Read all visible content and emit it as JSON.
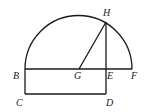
{
  "diagram": {
    "type": "geometry",
    "points": {
      "B": {
        "label": "B",
        "x": 25,
        "y": 69
      },
      "G": {
        "label": "G",
        "x": 79,
        "y": 69
      },
      "E": {
        "label": "E",
        "x": 106,
        "y": 69
      },
      "F": {
        "label": "F",
        "x": 132,
        "y": 69
      },
      "H": {
        "label": "H",
        "x": 106,
        "y": 22
      },
      "C": {
        "label": "C",
        "x": 25,
        "y": 94
      },
      "D": {
        "label": "D",
        "x": 106,
        "y": 94
      }
    },
    "segments": [
      "BF",
      "BC",
      "CD",
      "DE",
      "EH",
      "GH"
    ],
    "arcs": [
      {
        "center": "G",
        "from": "B",
        "to": "F",
        "type": "semicircle"
      }
    ],
    "labels": {
      "B": "B",
      "G": "G",
      "E": "E",
      "F": "F",
      "H": "H",
      "C": "C",
      "D": "D"
    },
    "stroke_color": "#1a1a1a",
    "background": "#ffffff"
  }
}
